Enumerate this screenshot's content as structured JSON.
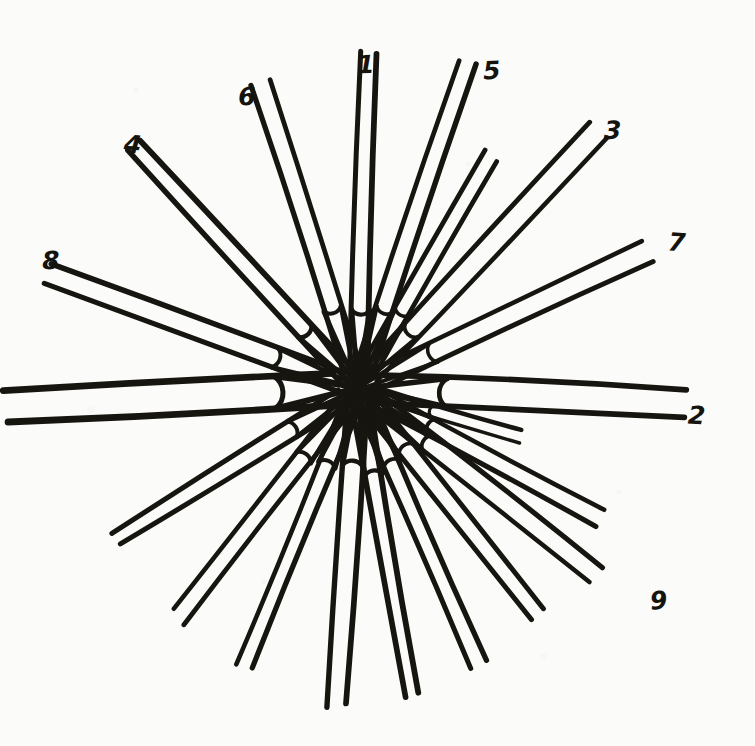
{
  "figure": {
    "style": "hand-drawn ink on paper",
    "ink_color": "#17150f",
    "paper_color": "#fbfbf9",
    "center": {
      "x": 358,
      "y": 388,
      "dot_label": "centre-point"
    },
    "rosette_radius": 95,
    "spoke_count": 18,
    "labeled_spoke_count": 9
  },
  "labels": [
    {
      "id": "label-1",
      "text": "1",
      "x": 357,
      "y": 52,
      "angle_deg": -88
    },
    {
      "id": "label-2",
      "text": "2",
      "x": 688,
      "y": 403,
      "angle_deg": 3
    },
    {
      "id": "label-3",
      "text": "3",
      "x": 604,
      "y": 118,
      "angle_deg": -47
    },
    {
      "id": "label-4",
      "text": "4",
      "x": 124,
      "y": 132,
      "angle_deg": -133
    },
    {
      "id": "label-5",
      "text": "5",
      "x": 483,
      "y": 58,
      "angle_deg": -71
    },
    {
      "id": "label-6",
      "text": "6",
      "x": 238,
      "y": 84,
      "angle_deg": -108
    },
    {
      "id": "label-7",
      "text": "7",
      "x": 668,
      "y": 230,
      "angle_deg": -25
    },
    {
      "id": "label-8",
      "text": "8",
      "x": 42,
      "y": 248,
      "angle_deg": -160
    },
    {
      "id": "label-9",
      "text": "9",
      "x": 650,
      "y": 588,
      "angle_deg": 38
    }
  ],
  "chart_data": {
    "type": "scatter",
    "xlabel": "",
    "ylabel": "",
    "legend": [],
    "center": [
      358,
      388
    ],
    "categories": [
      "1",
      "2",
      "3",
      "4",
      "5",
      "6",
      "7",
      "8",
      "9"
    ],
    "values": [
      336,
      330,
      352,
      330,
      345,
      320,
      320,
      330,
      300
    ],
    "spokes": [
      {
        "label": "1",
        "angle_deg": -88,
        "length": 336,
        "stroke": 5.5,
        "half_width": 9,
        "numbered": true
      },
      {
        "label": "5",
        "angle_deg": -71,
        "length": 345,
        "stroke": 5.0,
        "half_width": 9,
        "numbered": true
      },
      {
        "label": "",
        "angle_deg": -60,
        "length": 268,
        "stroke": 4.5,
        "half_width": 8,
        "numbered": false
      },
      {
        "label": "3",
        "angle_deg": -47,
        "length": 352,
        "stroke": 5.0,
        "half_width": 9,
        "numbered": true
      },
      {
        "label": "7",
        "angle_deg": -25,
        "length": 320,
        "stroke": 4.5,
        "half_width": 10,
        "numbered": true
      },
      {
        "label": "2",
        "angle_deg": 3,
        "length": 330,
        "stroke": 6.0,
        "half_width": 14,
        "numbered": true
      },
      {
        "label": "",
        "angle_deg": 17,
        "length": 170,
        "stroke": 4.0,
        "half_width": 6,
        "numbered": false
      },
      {
        "label": "",
        "angle_deg": 28,
        "length": 275,
        "stroke": 5.0,
        "half_width": 9,
        "numbered": false
      },
      {
        "label": "9",
        "angle_deg": 38,
        "length": 300,
        "stroke": 5.0,
        "half_width": 9,
        "numbered": true
      },
      {
        "label": "",
        "angle_deg": 52,
        "length": 290,
        "stroke": 5.0,
        "half_width": 9,
        "numbered": false
      },
      {
        "label": "",
        "angle_deg": 66,
        "length": 300,
        "stroke": 5.0,
        "half_width": 9,
        "numbered": false
      },
      {
        "label": "",
        "angle_deg": 80,
        "length": 310,
        "stroke": 5.5,
        "half_width": 9,
        "numbered": false
      },
      {
        "label": "",
        "angle_deg": 94,
        "length": 318,
        "stroke": 5.5,
        "half_width": 10,
        "numbered": false
      },
      {
        "label": "",
        "angle_deg": 112,
        "length": 300,
        "stroke": 5.0,
        "half_width": 9,
        "numbered": false
      },
      {
        "label": "",
        "angle_deg": 128,
        "length": 290,
        "stroke": 5.0,
        "half_width": 9,
        "numbered": false
      },
      {
        "label": "",
        "angle_deg": 148,
        "length": 285,
        "stroke": 5.0,
        "half_width": 9,
        "numbered": false
      },
      {
        "label": "",
        "angle_deg": 177,
        "length": 352,
        "stroke": 6.5,
        "half_width": 16,
        "numbered": false
      },
      {
        "label": "8",
        "angle_deg": -160,
        "length": 330,
        "stroke": 5.0,
        "half_width": 10,
        "numbered": true
      },
      {
        "label": "4",
        "angle_deg": -133,
        "length": 330,
        "stroke": 5.5,
        "half_width": 9,
        "numbered": true
      },
      {
        "label": "6",
        "angle_deg": -108,
        "length": 320,
        "stroke": 5.0,
        "half_width": 9,
        "numbered": false
      }
    ]
  }
}
